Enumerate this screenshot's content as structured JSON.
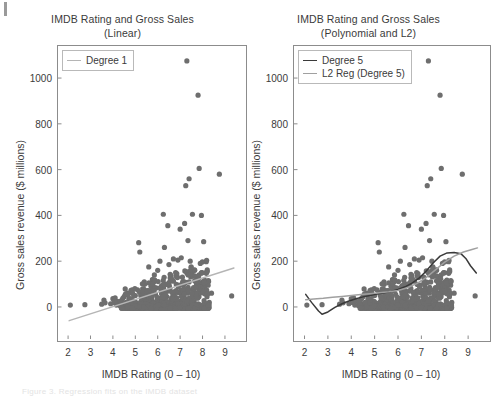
{
  "figure": {
    "background_color": "#ffffff",
    "point_color": "#6e6e6e",
    "degree1_color": "#b5b5b5",
    "degree5_color": "#3a3a3a",
    "l2_color": "#a0a0a0",
    "axis_color": "#8c8c8c",
    "corner_mark_name": "crop-mark"
  },
  "footer": {
    "ghost_text": "Figure 3. Regression fits on the IMDB dataset"
  },
  "panels": [
    {
      "id": "linear",
      "title": "IMDB Rating and Gross Sales",
      "subtitle": "(Linear)",
      "legend_position": "top-left",
      "legend": [
        {
          "label": "Degree 1",
          "color": "#b5b5b5"
        }
      ]
    },
    {
      "id": "polynomial",
      "title": "IMDB Rating and Gross Sales",
      "subtitle": "(Polynomial and L2)",
      "legend_position": "top-left",
      "legend": [
        {
          "label": "Degree 5",
          "color": "#3a3a3a"
        },
        {
          "label": "L2 Reg (Degree 5)",
          "color": "#a0a0a0"
        }
      ]
    }
  ],
  "chart_data": [
    {
      "type": "scatter",
      "panel": "linear",
      "title": "IMDB Rating and Gross Sales (Linear)",
      "xlabel": "IMDB Rating (0 – 10)",
      "ylabel": "Gross sales revenue ($ millions)",
      "xlim": [
        1.55,
        9.85
      ],
      "ylim": [
        -140,
        1140
      ],
      "xticks": [
        2,
        3,
        4,
        5,
        6,
        7,
        8,
        9
      ],
      "yticks": [
        0,
        200,
        400,
        600,
        800,
        1000
      ],
      "grid": false,
      "legend": [
        "Degree 1"
      ],
      "series": [
        {
          "name": "Movies",
          "type": "scatter",
          "marker_color": "#6e6e6e",
          "marker_size": 2.6,
          "points": [
            [
              2.1,
              8
            ],
            [
              2.75,
              10
            ],
            [
              3.5,
              12
            ],
            [
              3.6,
              30
            ],
            [
              3.65,
              18
            ],
            [
              3.9,
              14
            ],
            [
              4.0,
              36
            ],
            [
              4.05,
              20
            ],
            [
              4.1,
              40
            ],
            [
              4.15,
              8
            ],
            [
              4.2,
              25
            ],
            [
              4.3,
              6
            ],
            [
              4.35,
              15
            ],
            [
              4.4,
              30
            ],
            [
              4.45,
              10
            ],
            [
              4.5,
              45
            ],
            [
              4.55,
              12
            ],
            [
              4.6,
              20
            ],
            [
              4.65,
              60
            ],
            [
              4.7,
              8
            ],
            [
              4.75,
              22
            ],
            [
              4.8,
              35
            ],
            [
              4.85,
              14
            ],
            [
              4.9,
              28
            ],
            [
              4.95,
              9
            ],
            [
              5.0,
              50
            ],
            [
              5.05,
              18
            ],
            [
              5.1,
              75
            ],
            [
              5.15,
              281
            ],
            [
              5.2,
              240
            ],
            [
              5.25,
              12
            ],
            [
              5.3,
              40
            ],
            [
              5.35,
              24
            ],
            [
              5.4,
              110
            ],
            [
              5.45,
              16
            ],
            [
              5.5,
              60
            ],
            [
              5.55,
              30
            ],
            [
              5.6,
              175
            ],
            [
              5.65,
              20
            ],
            [
              5.7,
              90
            ],
            [
              5.75,
              45
            ],
            [
              5.8,
              12
            ],
            [
              5.85,
              140
            ],
            [
              5.9,
              55
            ],
            [
              5.95,
              25
            ],
            [
              6.0,
              160
            ],
            [
              6.05,
              35
            ],
            [
              6.1,
              200
            ],
            [
              6.15,
              70
            ],
            [
              6.2,
              18
            ],
            [
              6.25,
              405
            ],
            [
              6.3,
              260
            ],
            [
              6.35,
              100
            ],
            [
              6.4,
              45
            ],
            [
              6.45,
              355
            ],
            [
              6.5,
              185
            ],
            [
              6.55,
              80
            ],
            [
              6.6,
              30
            ],
            [
              6.65,
              120
            ],
            [
              6.7,
              210
            ],
            [
              6.75,
              60
            ],
            [
              6.8,
              150
            ],
            [
              6.85,
              40
            ],
            [
              6.9,
              205
            ],
            [
              6.95,
              95
            ],
            [
              7.0,
              340
            ],
            [
              7.05,
              215
            ],
            [
              7.1,
              130
            ],
            [
              7.15,
              75
            ],
            [
              7.2,
              365
            ],
            [
              7.25,
              530
            ],
            [
              7.3,
              1075
            ],
            [
              7.35,
              290
            ],
            [
              7.4,
              560
            ],
            [
              7.45,
              200
            ],
            [
              7.5,
              145
            ],
            [
              7.55,
              405
            ],
            [
              7.6,
              85
            ],
            [
              7.65,
              160
            ],
            [
              7.7,
              60
            ],
            [
              7.75,
              120
            ],
            [
              7.8,
              925
            ],
            [
              7.85,
              605
            ],
            [
              7.9,
              190
            ],
            [
              7.95,
              400
            ],
            [
              8.0,
              110
            ],
            [
              8.05,
              285
            ],
            [
              8.1,
              70
            ],
            [
              8.15,
              150
            ],
            [
              8.2,
              45
            ],
            [
              8.25,
              95
            ],
            [
              8.3,
              20
            ],
            [
              8.4,
              60
            ],
            [
              8.75,
              580
            ],
            [
              9.3,
              48
            ]
          ]
        },
        {
          "name": "Degree 1",
          "type": "line",
          "color": "#b5b5b5",
          "fit": "linear",
          "endpoints": [
            [
              2.05,
              -60
            ],
            [
              9.4,
              170
            ]
          ]
        }
      ]
    },
    {
      "type": "scatter",
      "panel": "polynomial",
      "title": "IMDB Rating and Gross Sales (Polynomial and L2)",
      "xlabel": "IMDB Rating (0 – 10)",
      "ylabel": "Gross sales revenue ($ millions)",
      "xlim": [
        1.55,
        9.85
      ],
      "ylim": [
        -140,
        1140
      ],
      "xticks": [
        2,
        3,
        4,
        5,
        6,
        7,
        8,
        9
      ],
      "yticks": [
        0,
        200,
        400,
        600,
        800,
        1000
      ],
      "grid": false,
      "legend": [
        "Degree 5",
        "L2 Reg (Degree 5)"
      ],
      "series": [
        {
          "name": "Movies",
          "type": "scatter",
          "marker_color": "#6e6e6e",
          "marker_size": 2.6,
          "points": [
            [
              2.1,
              8
            ],
            [
              2.75,
              10
            ],
            [
              3.5,
              12
            ],
            [
              3.6,
              30
            ],
            [
              3.65,
              18
            ],
            [
              3.9,
              14
            ],
            [
              4.0,
              36
            ],
            [
              4.05,
              20
            ],
            [
              4.1,
              40
            ],
            [
              4.15,
              8
            ],
            [
              4.2,
              25
            ],
            [
              4.3,
              6
            ],
            [
              4.35,
              15
            ],
            [
              4.4,
              30
            ],
            [
              4.45,
              10
            ],
            [
              4.5,
              45
            ],
            [
              4.55,
              12
            ],
            [
              4.6,
              20
            ],
            [
              4.65,
              60
            ],
            [
              4.7,
              8
            ],
            [
              4.75,
              22
            ],
            [
              4.8,
              35
            ],
            [
              4.85,
              14
            ],
            [
              4.9,
              28
            ],
            [
              4.95,
              9
            ],
            [
              5.0,
              50
            ],
            [
              5.05,
              18
            ],
            [
              5.1,
              75
            ],
            [
              5.15,
              281
            ],
            [
              5.2,
              240
            ],
            [
              5.25,
              12
            ],
            [
              5.3,
              40
            ],
            [
              5.35,
              24
            ],
            [
              5.4,
              110
            ],
            [
              5.45,
              16
            ],
            [
              5.5,
              60
            ],
            [
              5.55,
              30
            ],
            [
              5.6,
              175
            ],
            [
              5.65,
              20
            ],
            [
              5.7,
              90
            ],
            [
              5.75,
              45
            ],
            [
              5.8,
              12
            ],
            [
              5.85,
              140
            ],
            [
              5.9,
              55
            ],
            [
              5.95,
              25
            ],
            [
              6.0,
              160
            ],
            [
              6.05,
              35
            ],
            [
              6.1,
              200
            ],
            [
              6.15,
              70
            ],
            [
              6.2,
              18
            ],
            [
              6.25,
              405
            ],
            [
              6.3,
              260
            ],
            [
              6.35,
              100
            ],
            [
              6.4,
              45
            ],
            [
              6.45,
              355
            ],
            [
              6.5,
              185
            ],
            [
              6.55,
              80
            ],
            [
              6.6,
              30
            ],
            [
              6.65,
              120
            ],
            [
              6.7,
              210
            ],
            [
              6.75,
              60
            ],
            [
              6.8,
              150
            ],
            [
              6.85,
              40
            ],
            [
              6.9,
              205
            ],
            [
              6.95,
              95
            ],
            [
              7.0,
              340
            ],
            [
              7.05,
              215
            ],
            [
              7.1,
              130
            ],
            [
              7.15,
              75
            ],
            [
              7.2,
              365
            ],
            [
              7.25,
              530
            ],
            [
              7.3,
              1075
            ],
            [
              7.35,
              290
            ],
            [
              7.4,
              560
            ],
            [
              7.45,
              200
            ],
            [
              7.5,
              145
            ],
            [
              7.55,
              405
            ],
            [
              7.6,
              85
            ],
            [
              7.65,
              160
            ],
            [
              7.7,
              60
            ],
            [
              7.75,
              120
            ],
            [
              7.8,
              925
            ],
            [
              7.85,
              605
            ],
            [
              7.9,
              190
            ],
            [
              7.95,
              400
            ],
            [
              8.0,
              110
            ],
            [
              8.05,
              285
            ],
            [
              8.1,
              70
            ],
            [
              8.15,
              150
            ],
            [
              8.2,
              45
            ],
            [
              8.25,
              95
            ],
            [
              8.3,
              20
            ],
            [
              8.4,
              60
            ],
            [
              8.75,
              580
            ],
            [
              9.3,
              48
            ]
          ]
        },
        {
          "name": "Degree 5",
          "type": "line",
          "color": "#3a3a3a",
          "curve": [
            [
              2.05,
              55
            ],
            [
              2.3,
              20
            ],
            [
              2.6,
              -18
            ],
            [
              2.75,
              -32
            ],
            [
              3.0,
              -22
            ],
            [
              3.3,
              -2
            ],
            [
              3.6,
              14
            ],
            [
              3.9,
              26
            ],
            [
              4.2,
              36
            ],
            [
              4.5,
              44
            ],
            [
              4.8,
              50
            ],
            [
              5.1,
              56
            ],
            [
              5.4,
              62
            ],
            [
              5.7,
              68
            ],
            [
              6.0,
              76
            ],
            [
              6.3,
              88
            ],
            [
              6.6,
              104
            ],
            [
              6.9,
              126
            ],
            [
              7.2,
              156
            ],
            [
              7.5,
              192
            ],
            [
              7.8,
              222
            ],
            [
              8.1,
              236
            ],
            [
              8.4,
              238
            ],
            [
              8.7,
              232
            ],
            [
              8.9,
              212
            ],
            [
              9.1,
              180
            ],
            [
              9.35,
              148
            ]
          ]
        },
        {
          "name": "L2 Reg (Degree 5)",
          "type": "line",
          "color": "#a0a0a0",
          "curve": [
            [
              2.05,
              32
            ],
            [
              2.4,
              35
            ],
            [
              2.8,
              38
            ],
            [
              3.2,
              42
            ],
            [
              3.6,
              46
            ],
            [
              4.0,
              50
            ],
            [
              4.4,
              54
            ],
            [
              4.8,
              58
            ],
            [
              5.2,
              62
            ],
            [
              5.6,
              66
            ],
            [
              6.0,
              72
            ],
            [
              6.4,
              84
            ],
            [
              6.8,
              102
            ],
            [
              7.2,
              128
            ],
            [
              7.6,
              162
            ],
            [
              8.0,
              196
            ],
            [
              8.4,
              222
            ],
            [
              8.8,
              240
            ],
            [
              9.2,
              252
            ],
            [
              9.4,
              258
            ]
          ]
        }
      ]
    }
  ]
}
